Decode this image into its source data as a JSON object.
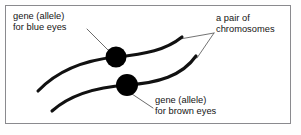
{
  "figure": {
    "background_color": "#ffffff",
    "border_color": "#8a8a8e",
    "ink_color": "#111111",
    "leader_color": "#555555"
  },
  "labels": {
    "blue_eyes": {
      "line1": "gene (allele)",
      "line2": "for blue eyes"
    },
    "chromosomes": {
      "line1": "a pair of",
      "line2": "chromosomes"
    },
    "brown_eyes": {
      "line1": "gene (allele)",
      "line2": "for brown eyes"
    }
  },
  "diagram": {
    "genes": [
      {
        "name": "blue-eye-allele",
        "cx": 116,
        "cy": 57,
        "r": 10.5,
        "color": "#000000"
      },
      {
        "name": "brown-eye-allele",
        "cx": 127,
        "cy": 85,
        "r": 11.0,
        "color": "#000000"
      }
    ],
    "chromosomes": [
      {
        "name": "upper-chromosome",
        "path": "M 38 91 C 58 70 86 60 116 57 C 146 54 166 50 182 37"
      },
      {
        "name": "lower-chromosome",
        "path": "M 52 111 C 72 93 99 87 127 85 C 158 83 182 76 196 56"
      }
    ],
    "leaders": [
      {
        "name": "leader-blue-eyes",
        "x1": 87,
        "y1": 29,
        "x2": 110,
        "y2": 52
      },
      {
        "name": "leader-brown-eyes",
        "x1": 132,
        "y1": 94,
        "x2": 153,
        "y2": 108
      },
      {
        "name": "leader-chromosome-upper",
        "x1": 214,
        "y1": 33,
        "x2": 180,
        "y2": 39
      },
      {
        "name": "leader-chromosome-lower",
        "x1": 214,
        "y1": 33,
        "x2": 197,
        "y2": 58
      }
    ]
  }
}
